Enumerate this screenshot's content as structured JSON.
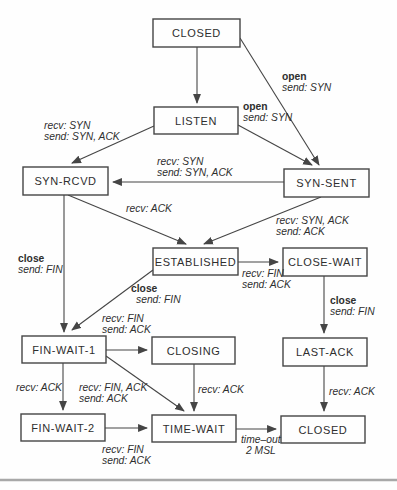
{
  "figure": "TCP state transition diagram",
  "colors": {
    "line": "#454545",
    "text": "#2e2e2e",
    "box_fill": "#fefefe",
    "page_rule": "#9a9a9a",
    "background": "#fefefe"
  },
  "diagram": {
    "nodes": [
      {
        "id": "closed-top",
        "label": "CLOSED",
        "x": 153,
        "y": 19,
        "w": 87,
        "h": 28
      },
      {
        "id": "listen",
        "label": "LISTEN",
        "x": 154,
        "y": 107,
        "w": 84,
        "h": 27
      },
      {
        "id": "syn-rcvd",
        "label": "SYN-RCVD",
        "x": 23,
        "y": 167,
        "w": 85,
        "h": 28
      },
      {
        "id": "syn-sent",
        "label": "SYN-SENT",
        "x": 284,
        "y": 169,
        "w": 85,
        "h": 28
      },
      {
        "id": "established",
        "label": "ESTABLISHED",
        "x": 153,
        "y": 248,
        "w": 85,
        "h": 27
      },
      {
        "id": "close-wait",
        "label": "CLOSE-WAIT",
        "x": 283,
        "y": 248,
        "w": 84,
        "h": 28
      },
      {
        "id": "fin-wait-1",
        "label": "FIN-WAIT-1",
        "x": 22,
        "y": 336,
        "w": 84,
        "h": 27
      },
      {
        "id": "closing",
        "label": "CLOSING",
        "x": 152,
        "y": 337,
        "w": 83,
        "h": 27
      },
      {
        "id": "last-ack",
        "label": "LAST-ACK",
        "x": 283,
        "y": 338,
        "w": 84,
        "h": 28
      },
      {
        "id": "fin-wait-2",
        "label": "FIN-WAIT-2",
        "x": 21,
        "y": 414,
        "w": 84,
        "h": 27
      },
      {
        "id": "time-wait",
        "label": "TIME-WAIT",
        "x": 152,
        "y": 415,
        "w": 84,
        "h": 27
      },
      {
        "id": "closed-bottom",
        "label": "CLOSED",
        "x": 281,
        "y": 416,
        "w": 84,
        "h": 27
      }
    ],
    "edges": [
      {
        "id": "closed-to-listen",
        "x1": 197,
        "y1": 47,
        "x2": 197,
        "y2": 103
      },
      {
        "id": "closed-to-syn-sent",
        "x1": 240,
        "y1": 38,
        "x2": 319,
        "y2": 165
      },
      {
        "id": "listen-to-syn-sent",
        "x1": 238,
        "y1": 125,
        "x2": 312,
        "y2": 165
      },
      {
        "id": "listen-to-syn-rcvd",
        "x1": 154,
        "y1": 126,
        "x2": 72,
        "y2": 163
      },
      {
        "id": "syn-sent-to-syn-rcvd",
        "x1": 284,
        "y1": 182,
        "x2": 113,
        "y2": 182
      },
      {
        "id": "syn-rcvd-to-established",
        "x1": 68,
        "y1": 195,
        "x2": 186,
        "y2": 244
      },
      {
        "id": "syn-sent-to-established",
        "x1": 321,
        "y1": 197,
        "x2": 204,
        "y2": 244
      },
      {
        "id": "syn-rcvd-to-fin-wait-1",
        "x1": 64,
        "y1": 195,
        "x2": 64,
        "y2": 332
      },
      {
        "id": "established-to-fin-wait-1",
        "x1": 153,
        "y1": 270,
        "x2": 72,
        "y2": 330
      },
      {
        "id": "fin-wait-1-to-closing",
        "x1": 106,
        "y1": 350,
        "x2": 147,
        "y2": 350
      },
      {
        "id": "fin-wait-1-to-time-wait",
        "x1": 106,
        "y1": 356,
        "x2": 184,
        "y2": 411
      },
      {
        "id": "fin-wait-1-to-fin-wait-2",
        "x1": 63,
        "y1": 363,
        "x2": 63,
        "y2": 410
      },
      {
        "id": "closing-to-time-wait",
        "x1": 194,
        "y1": 364,
        "x2": 194,
        "y2": 411
      },
      {
        "id": "fin-wait-2-to-time-wait",
        "x1": 105,
        "y1": 428,
        "x2": 147,
        "y2": 428
      },
      {
        "id": "time-wait-to-closed",
        "x1": 236,
        "y1": 429,
        "x2": 276,
        "y2": 429
      },
      {
        "id": "established-to-close-wait",
        "x1": 238,
        "y1": 262,
        "x2": 278,
        "y2": 262
      },
      {
        "id": "close-wait-to-last-ack",
        "x1": 324,
        "y1": 276,
        "x2": 324,
        "y2": 333
      },
      {
        "id": "last-ack-to-closed",
        "x1": 324,
        "y1": 366,
        "x2": 324,
        "y2": 411
      }
    ],
    "labels": [
      {
        "id": "open-send-syn-upper",
        "x": 282,
        "y": 71,
        "lines": [
          {
            "t": "open",
            "s": "bold"
          },
          {
            "t": "send: SYN",
            "s": "italic"
          }
        ]
      },
      {
        "id": "open-send-syn-lower",
        "x": 243,
        "y": 101,
        "lines": [
          {
            "t": "open",
            "s": "bold"
          },
          {
            "t": "send: SYN",
            "s": "italic"
          }
        ]
      },
      {
        "id": "recv-syn-send-syn-ack-left",
        "x": 44,
        "y": 120,
        "lines": [
          {
            "t": "recv: SYN",
            "s": "italic"
          },
          {
            "t": "send: SYN, ACK",
            "s": "italic"
          }
        ]
      },
      {
        "id": "recv-syn-send-syn-ack-mid",
        "x": 157,
        "y": 156,
        "lines": [
          {
            "t": "recv: SYN",
            "s": "italic"
          },
          {
            "t": "send: SYN, ACK",
            "s": "italic"
          }
        ]
      },
      {
        "id": "recv-ack-syn-rcvd",
        "x": 126,
        "y": 203,
        "lines": [
          {
            "t": "recv: ACK",
            "s": "italic"
          }
        ]
      },
      {
        "id": "recv-syn-ack-send-ack",
        "x": 276,
        "y": 215,
        "lines": [
          {
            "t": "recv: SYN, ACK",
            "s": "italic"
          },
          {
            "t": "send: ACK",
            "s": "italic"
          }
        ]
      },
      {
        "id": "close-send-fin-left",
        "x": 18,
        "y": 253,
        "lines": [
          {
            "t": "close",
            "s": "bold"
          },
          {
            "t": "send: FIN",
            "s": "italic"
          }
        ]
      },
      {
        "id": "recv-fin-send-ack-close-wait",
        "x": 242,
        "y": 268,
        "lines": [
          {
            "t": "recv: FIN",
            "s": "italic"
          },
          {
            "t": "send: ACK",
            "s": "italic"
          }
        ]
      },
      {
        "id": "close-send-fin-mid",
        "x": 131,
        "y": 283,
        "lines": [
          {
            "t": "close",
            "s": "bold"
          },
          {
            "t": "send: FIN",
            "s": "italic",
            "dx": 5
          }
        ]
      },
      {
        "id": "recv-fin-send-ack-closing",
        "x": 102,
        "y": 313,
        "lines": [
          {
            "t": "recv: FIN",
            "s": "italic"
          },
          {
            "t": "send: ACK",
            "s": "italic"
          }
        ]
      },
      {
        "id": "close-send-fin-right",
        "x": 330,
        "y": 295,
        "lines": [
          {
            "t": "close",
            "s": "bold"
          },
          {
            "t": "send: FIN",
            "s": "italic"
          }
        ]
      },
      {
        "id": "recv-ack-fin-wait",
        "x": 16,
        "y": 382,
        "lines": [
          {
            "t": "recv: ACK",
            "s": "italic"
          }
        ]
      },
      {
        "id": "recv-fin-ack-send-ack",
        "x": 79,
        "y": 382,
        "lines": [
          {
            "t": "recv: FIN, ACK",
            "s": "italic"
          },
          {
            "t": "send: ACK",
            "s": "italic"
          }
        ]
      },
      {
        "id": "recv-ack-closing",
        "x": 198,
        "y": 384,
        "lines": [
          {
            "t": "recv: ACK",
            "s": "italic"
          }
        ]
      },
      {
        "id": "recv-ack-last-ack",
        "x": 329,
        "y": 386,
        "lines": [
          {
            "t": "recv: ACK",
            "s": "italic"
          }
        ]
      },
      {
        "id": "recv-fin-send-ack-time-wait",
        "x": 102,
        "y": 444,
        "lines": [
          {
            "t": "recv: FIN",
            "s": "italic"
          },
          {
            "t": "send: ACK",
            "s": "italic"
          }
        ]
      },
      {
        "id": "timeout-2msl",
        "x": 241,
        "y": 434,
        "lines": [
          {
            "t": "time–out",
            "s": "italic"
          },
          {
            "t": "2 MSL",
            "s": "italic",
            "dx": 5
          }
        ]
      }
    ]
  }
}
